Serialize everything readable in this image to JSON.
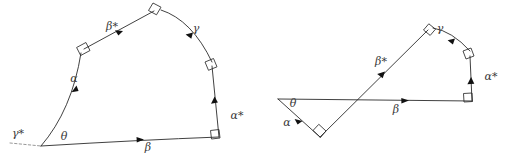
{
  "figure": {
    "background_color": "#ffffff",
    "stroke_color": "#2b2b2b",
    "dashed_color": "#8d8d8d",
    "label_color": "#3a3a3a",
    "width": 519,
    "height": 166
  },
  "left_diagram": {
    "name": "convex-pentagon-path",
    "labels": {
      "gamma_star": "γ*",
      "theta": "θ",
      "alpha": "α",
      "beta_star": "β*",
      "gamma": "γ",
      "alpha_star": "α*",
      "beta": "β"
    },
    "label_positions": {
      "gamma_star": {
        "x": 18,
        "y": 134
      },
      "theta": {
        "x": 64,
        "y": 137
      },
      "alpha": {
        "x": 74,
        "y": 79
      },
      "beta_star": {
        "x": 112,
        "y": 27
      },
      "gamma": {
        "x": 196,
        "y": 29
      },
      "alpha_star": {
        "x": 237,
        "y": 116
      },
      "beta": {
        "x": 148,
        "y": 148
      }
    },
    "right_angle_count": 4,
    "arrow_count": 5
  },
  "right_diagram": {
    "name": "crossed-path-with-triangle",
    "labels": {
      "theta": "θ",
      "alpha": "α",
      "beta": "β",
      "beta_star": "β*",
      "gamma": "γ",
      "alpha_star": "α*"
    },
    "label_positions": {
      "theta": {
        "x": 293,
        "y": 104
      },
      "alpha": {
        "x": 287,
        "y": 123
      },
      "beta": {
        "x": 396,
        "y": 110
      },
      "beta_star": {
        "x": 381,
        "y": 62
      },
      "gamma": {
        "x": 440,
        "y": 29
      },
      "alpha_star": {
        "x": 491,
        "y": 77
      }
    },
    "right_angle_count": 4,
    "arrow_count": 5
  }
}
